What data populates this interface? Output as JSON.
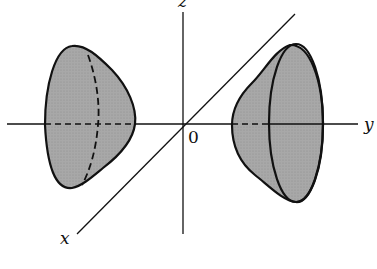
{
  "figure": {
    "axes": {
      "z_label": "z",
      "y_label": "y",
      "x_label": "x",
      "origin_label": "0"
    },
    "colors": {
      "surface_fill": "#a8a8a8",
      "stroke": "#111111",
      "background": "#ffffff"
    }
  }
}
